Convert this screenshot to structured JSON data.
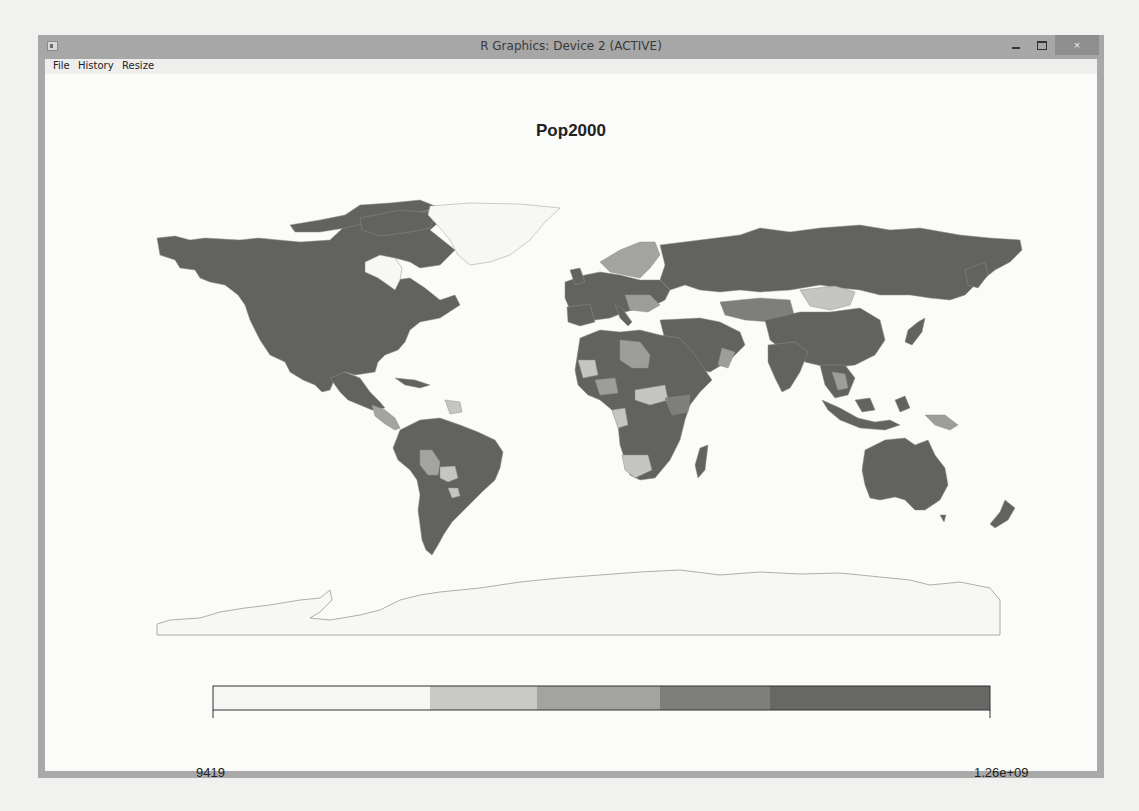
{
  "window": {
    "title": "R Graphics: Device 2 (ACTIVE)",
    "controls": {
      "minimize": "minimize",
      "maximize": "maximize",
      "close": "×"
    }
  },
  "menubar": {
    "items": [
      {
        "label": "File"
      },
      {
        "label": "History"
      },
      {
        "label": "Resize"
      }
    ]
  },
  "plot": {
    "title": "Pop2000",
    "type": "choropleth world map",
    "projection": "equirectangular",
    "variable": "Pop2000"
  },
  "legend": {
    "min_label": "9419",
    "max_label": "1.26e+09",
    "bins": [
      {
        "color": "#f6f6f4",
        "fraction": 0.279
      },
      {
        "color": "#c9c9c7",
        "fraction": 0.138
      },
      {
        "color": "#a3a3a1",
        "fraction": 0.158
      },
      {
        "color": "#7e7e7c",
        "fraction": 0.141
      },
      {
        "color": "#676765",
        "fraction": 0.284
      }
    ]
  },
  "colors": {
    "darkest": "#5f5f5d",
    "dark": "#7a7a78",
    "mid": "#9d9d9b",
    "light": "#c5c5c3",
    "none": "#f7f7f5",
    "outline": "#8a8a88"
  }
}
